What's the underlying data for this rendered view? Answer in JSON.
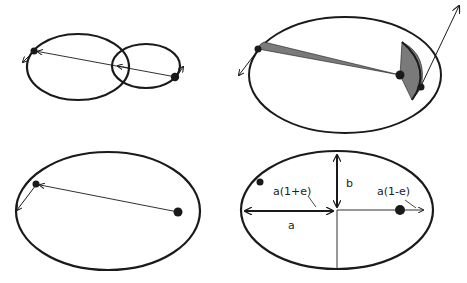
{
  "diagram": {
    "colors": {
      "stroke": "#1a1a1a",
      "shade": "#7a7a7a",
      "background": "#ffffff"
    },
    "panels": [
      {
        "id": "two-body-orbits",
        "description": "Two bodies orbiting common center of mass on intersecting ellipses"
      },
      {
        "id": "equal-areas",
        "description": "Equal areas swept in equal times (shaded sectors)"
      },
      {
        "id": "single-orbit",
        "description": "Planet on elliptical orbit with radius vector from focus"
      },
      {
        "id": "ellipse-geometry",
        "description": "Ellipse semi-axes and perihelion/aphelion distances"
      }
    ],
    "labels": {
      "semi_major": "a",
      "semi_minor": "b",
      "aphelion": "a(1+e)",
      "perihelion": "a(1-e)"
    }
  }
}
